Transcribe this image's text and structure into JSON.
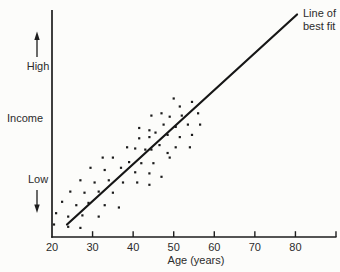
{
  "colors": {
    "ink": "#1d1d1d",
    "text": "#2b2b2b",
    "background": "#fcfcfa"
  },
  "chart_data": {
    "type": "scatter",
    "title": "",
    "xlabel": "Age (years)",
    "ylabel": "Income",
    "y_axis_annotations": {
      "high": "High",
      "low": "Low"
    },
    "x_ticks": [
      20,
      30,
      40,
      50,
      60,
      70,
      80
    ],
    "x_range": [
      20,
      90
    ],
    "y_range": [
      0,
      100
    ],
    "grid": false,
    "legend_position": "none",
    "line_label_lines": [
      "Line of",
      "best fit"
    ],
    "best_fit_line": {
      "x1": 23.7,
      "y1": 5.5,
      "x2": 80.4,
      "y2": 98
    },
    "points": [
      [
        41.5,
        48
      ],
      [
        44,
        47
      ],
      [
        41.5,
        43.5
      ],
      [
        44,
        44
      ],
      [
        38.5,
        39.5
      ],
      [
        40.5,
        39
      ],
      [
        43,
        38.5
      ],
      [
        50,
        61
      ],
      [
        51.5,
        57.5
      ],
      [
        54.5,
        59.5
      ],
      [
        47,
        54.5
      ],
      [
        44.5,
        53.5
      ],
      [
        49,
        53
      ],
      [
        52,
        53.5
      ],
      [
        56,
        54.5
      ],
      [
        47.5,
        49.5
      ],
      [
        50.5,
        48.5
      ],
      [
        53.5,
        49.5
      ],
      [
        56.5,
        49.5
      ],
      [
        45.5,
        46
      ],
      [
        48.5,
        45
      ],
      [
        51.5,
        44
      ],
      [
        54.5,
        45
      ],
      [
        46.5,
        40.5
      ],
      [
        50.5,
        39.5
      ],
      [
        54,
        39.5
      ],
      [
        44.5,
        38.5
      ],
      [
        48.5,
        37
      ],
      [
        32.5,
        35
      ],
      [
        35,
        35
      ],
      [
        39,
        33
      ],
      [
        42,
        32.5
      ],
      [
        29.5,
        30.5
      ],
      [
        33,
        29.5
      ],
      [
        37,
        30.5
      ],
      [
        40.5,
        28.5
      ],
      [
        44,
        28
      ],
      [
        27,
        25
      ],
      [
        30.5,
        24
      ],
      [
        34,
        25
      ],
      [
        37.5,
        24
      ],
      [
        41,
        24
      ],
      [
        44,
        23
      ],
      [
        24.5,
        20
      ],
      [
        28,
        19.5
      ],
      [
        31.5,
        20
      ],
      [
        35,
        19.5
      ],
      [
        22.5,
        15.5
      ],
      [
        26,
        14
      ],
      [
        29,
        15
      ],
      [
        33,
        14
      ],
      [
        36.5,
        13
      ],
      [
        21,
        10.5
      ],
      [
        24,
        9
      ],
      [
        27.5,
        9.5
      ],
      [
        31.5,
        9
      ],
      [
        20.5,
        5.5
      ],
      [
        24,
        4.5
      ],
      [
        27,
        4
      ],
      [
        49,
        35
      ],
      [
        45,
        32.5
      ],
      [
        47,
        26.5
      ]
    ]
  }
}
